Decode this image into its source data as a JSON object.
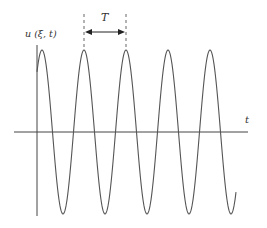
{
  "diagram": {
    "y_axis_label": "u (ξ, t)",
    "x_axis_label": "t",
    "period_label": "T",
    "colors": {
      "curve": "#555555",
      "axis": "#444444",
      "dashed": "#666666",
      "text": "#333333"
    },
    "wave": {
      "x_start": 37,
      "x_end": 236,
      "center_y": 132,
      "amplitude": 82,
      "period_px": 42,
      "first_peak_x": 42
    }
  }
}
